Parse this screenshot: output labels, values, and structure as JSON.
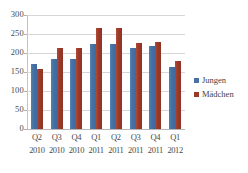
{
  "chart_data": {
    "type": "bar",
    "title": "",
    "subtitle": "",
    "xlabel": "",
    "ylabel": "",
    "ylim": [
      0,
      300
    ],
    "ytick_labels": [
      "300",
      "250",
      "200",
      "150",
      "100",
      "50",
      "0"
    ],
    "yticks": [
      300,
      250,
      200,
      150,
      100,
      50,
      0
    ],
    "grid": true,
    "legend_position": "right",
    "categories": [
      "Q2 2010",
      "Q3 2010",
      "Q4 2010",
      "Q1 2011",
      "Q2 2011",
      "Q3 2011",
      "Q4 2011",
      "Q1 2012"
    ],
    "category_quarters": [
      "Q2",
      "Q3",
      "Q4",
      "Q1",
      "Q2",
      "Q3",
      "Q4",
      "Q1"
    ],
    "category_years": [
      "2010",
      "2010",
      "2010",
      "2011",
      "2011",
      "2011",
      "2011",
      "2012"
    ],
    "series": [
      {
        "name": "Jungen",
        "color": "#4571a4",
        "values": [
          172,
          184,
          185,
          224,
          224,
          213,
          219,
          163
        ]
      },
      {
        "name": "Mädchen",
        "color": "#9c3a2a",
        "values": [
          159,
          212,
          213,
          267,
          267,
          226,
          228,
          180
        ]
      }
    ]
  },
  "legend": {
    "items": [
      {
        "label": "Jungen",
        "color": "#4571a4"
      },
      {
        "label": "Mädchen",
        "color": "#9c3a2a"
      }
    ]
  },
  "colors": {
    "series_jungen": "#4571a4",
    "series_maedchen": "#9c3a2a",
    "gridline": "#d6d6d6",
    "axis": "#b8b8b8",
    "text": "#4a4a4a",
    "background": "#ffffff"
  }
}
